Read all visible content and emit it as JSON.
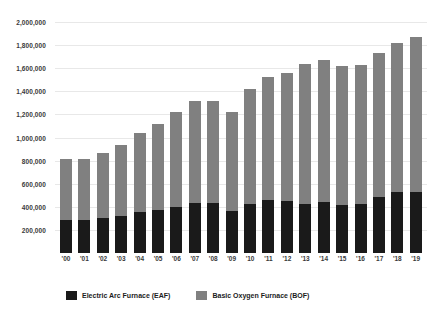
{
  "chart_data": {
    "type": "bar",
    "subtype": "stacked-vertical",
    "title": "",
    "subtitle": "",
    "xlabel": "",
    "ylabel": "",
    "ylim": [
      0,
      2000000
    ],
    "y_tick_interval": 200000,
    "grid": true,
    "legend_position": "bottom-left",
    "categories": [
      "'00",
      "'01",
      "'02",
      "'03",
      "'04",
      "'05",
      "'06",
      "'07",
      "'08",
      "'09",
      "'10",
      "'11",
      "'12",
      "'13",
      "'14",
      "'15",
      "'16",
      "'17",
      "'18",
      "'19"
    ],
    "y_tick_labels": [
      "2,000,000",
      "1,800,000",
      "1,600,000",
      "1,400,000",
      "1,200,000",
      "1,000,000",
      "800,000",
      "600,000",
      "400,000",
      "200,000"
    ],
    "y_tick_values": [
      2000000,
      1800000,
      1600000,
      1400000,
      1200000,
      1000000,
      800000,
      600000,
      400000,
      200000
    ],
    "series": [
      {
        "name": "Electric Arc Furnace (EAF)",
        "color": "#1a1a1a",
        "values": [
          285000,
          285000,
          305000,
          322000,
          355000,
          370000,
          402000,
          432000,
          435000,
          362000,
          428000,
          462000,
          452000,
          428000,
          440000,
          415000,
          425000,
          485000,
          532000,
          532000
        ]
      },
      {
        "name": "Basic Oxygen Furnace (BOF)",
        "color": "#808080",
        "values": [
          528000,
          528000,
          565000,
          615000,
          680000,
          750000,
          815000,
          880000,
          878000,
          860000,
          995000,
          1062000,
          1108000,
          1205000,
          1228000,
          1205000,
          1200000,
          1245000,
          1285000,
          1335000
        ]
      }
    ],
    "totals": [
      813000,
      813000,
      870000,
      937000,
      1035000,
      1120000,
      1217000,
      1312000,
      1313000,
      1222000,
      1423000,
      1524000,
      1560000,
      1633000,
      1668000,
      1620000,
      1625000,
      1730000,
      1817000,
      1867000
    ]
  },
  "legend": {
    "items": [
      {
        "label": "Electric Arc Furnace (EAF)",
        "swatch": "eaf",
        "color": "#1a1a1a"
      },
      {
        "label": "Basic Oxygen Furnace (BOF)",
        "swatch": "bof",
        "color": "#808080"
      }
    ]
  },
  "colors": {
    "background": "#ffffff",
    "gridline": "#e8e8e8",
    "tick_text": "#3a3a3a",
    "legend_text": "#1c1c1c"
  }
}
